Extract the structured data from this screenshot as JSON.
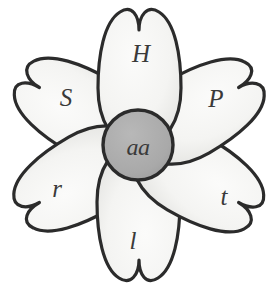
{
  "figure": {
    "kind": "flower-genotype-diagram",
    "background_color": "#ffffff",
    "outline_color": "#2b2b2b",
    "petal_fill_color": "#f6f6f4",
    "petal_shade_color": "#e3e3e1",
    "center_fill_color": "#a9a9a9",
    "label_color": "#3a3a3a"
  },
  "center": {
    "name": "flower-center",
    "label": "aa",
    "fill": "#a9a9a9"
  },
  "petals": [
    {
      "id": "petal-top",
      "label": "H",
      "angle": 0,
      "label_x": 141,
      "label_y": 53,
      "letter_case": "upper"
    },
    {
      "id": "petal-upper-right",
      "label": "P",
      "angle": 60,
      "label_x": 216,
      "label_y": 98,
      "letter_case": "upper"
    },
    {
      "id": "petal-lower-right",
      "label": "t",
      "angle": 120,
      "label_x": 224,
      "label_y": 196,
      "letter_case": "lower"
    },
    {
      "id": "petal-bottom",
      "label": "l",
      "angle": 180,
      "label_x": 133,
      "label_y": 240,
      "letter_case": "lower"
    },
    {
      "id": "petal-lower-left",
      "label": "r",
      "angle": 240,
      "label_x": 57,
      "label_y": 188,
      "letter_case": "lower"
    },
    {
      "id": "petal-upper-left",
      "label": "S",
      "angle": 300,
      "label_x": 66,
      "label_y": 97,
      "letter_case": "upper"
    }
  ]
}
